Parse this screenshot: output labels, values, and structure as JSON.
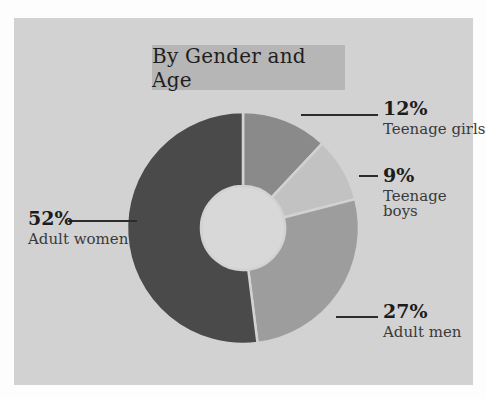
{
  "title": {
    "text": "By Gender and Age"
  },
  "colors": {
    "page_background": "#fdfdfd",
    "card_background": "#d2d2d2",
    "title_box": "#b6b6b6",
    "hole": "#d8d8d8",
    "leader_line": "#2c2c2c",
    "percent_text": "#1c1c1c",
    "name_text": "#3a3a3a"
  },
  "chart_data": {
    "type": "pie",
    "title": "By Gender and Age",
    "donut": true,
    "start_angle_deg": 0,
    "direction": "clockwise",
    "categories": [
      "Teenage girls",
      "Teenage boys",
      "Adult men",
      "Adult women"
    ],
    "values": [
      12,
      9,
      27,
      52
    ],
    "unit": "%",
    "colors": [
      "#8a8a8a",
      "#c2c2c2",
      "#9d9d9d",
      "#4a4a4a"
    ],
    "legend_position": "callouts",
    "labels": [
      {
        "percent": "12%",
        "name": "Teenage girls"
      },
      {
        "percent": "9%",
        "name": "Teenage boys"
      },
      {
        "percent": "27%",
        "name": "Adult men"
      },
      {
        "percent": "52%",
        "name": "Adult women"
      }
    ]
  }
}
